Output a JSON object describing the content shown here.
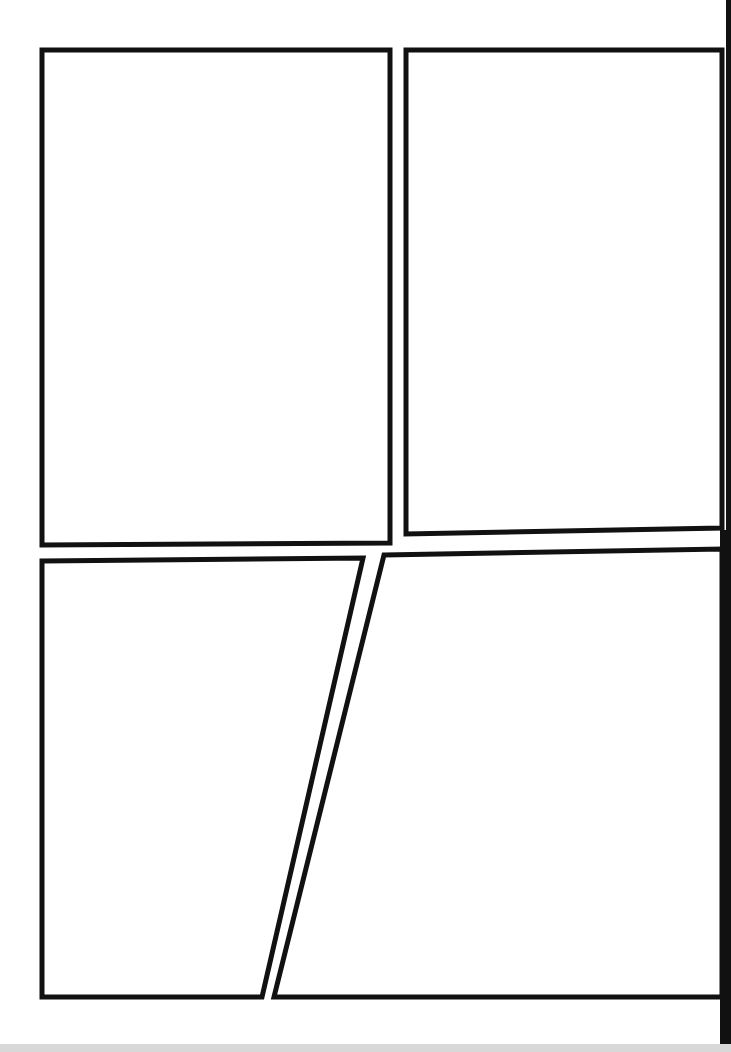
{
  "page": {
    "type": "comic-panel-template",
    "background": "#ffffff",
    "border_color": "#111111",
    "panel_count": 4
  },
  "panels": [
    {
      "id": "panel-1",
      "points": "42,50 390,50 390,543 42,545"
    },
    {
      "id": "panel-2",
      "points": "406,50 722,50 722,528 406,534"
    },
    {
      "id": "panel-3",
      "points": "42,561 363,558 262,997 42,997"
    },
    {
      "id": "panel-4",
      "points": "384,555 722,549 722,997 274,997"
    }
  ]
}
